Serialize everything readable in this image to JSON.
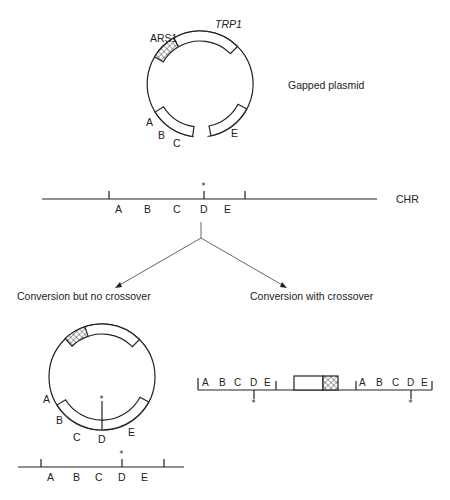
{
  "top_plasmid": {
    "title": "Gapped plasmid",
    "labels": {
      "ars": "ARS1",
      "trp": "TRP1",
      "a": "A",
      "b": "B",
      "c": "C",
      "e": "E"
    }
  },
  "chromosome": {
    "label": "CHR",
    "markers": [
      "A",
      "B",
      "C",
      "D",
      "E"
    ],
    "mutation_mark": "*"
  },
  "branches": {
    "left": "Conversion but no crossover",
    "right": "Conversion with crossover"
  },
  "result_no_crossover": {
    "plasmid_labels": {
      "a": "A",
      "b": "B",
      "c": "C",
      "d": "D",
      "e": "E"
    },
    "mutation_mark": "*",
    "chromosome_markers": [
      "A",
      "B",
      "C",
      "D",
      "E"
    ]
  },
  "result_crossover": {
    "left_markers": [
      "A",
      "B",
      "C",
      "D",
      "E"
    ],
    "right_markers": [
      "A",
      "B",
      "C",
      "D",
      "E"
    ],
    "mutation_mark": "*"
  },
  "colors": {
    "ink": "#222222",
    "background": "#ffffff"
  }
}
